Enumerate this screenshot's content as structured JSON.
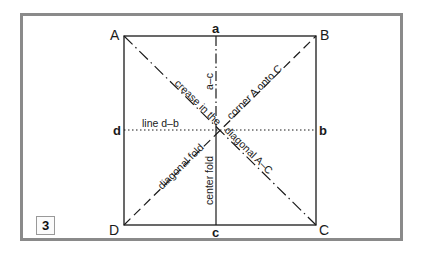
{
  "figure": {
    "step_number": "3",
    "corners": {
      "A": "A",
      "B": "B",
      "C": "C",
      "D": "D"
    },
    "midpoints": {
      "a": "a",
      "b": "b",
      "c": "c",
      "d": "d"
    },
    "labels": {
      "crease": "crease in the diagonal A–C",
      "crease_part1": "crease in the",
      "crease_part2": "diagonal A–C",
      "corner_onto": "corner A onto C",
      "a_c": "a–c",
      "line_db": "line d–b",
      "diagonal_fold": "diagonal fold",
      "center_fold": "center fold"
    },
    "colors": {
      "frame": "#8a8a8a",
      "line": "#1a1a1a",
      "background": "#ffffff"
    }
  }
}
